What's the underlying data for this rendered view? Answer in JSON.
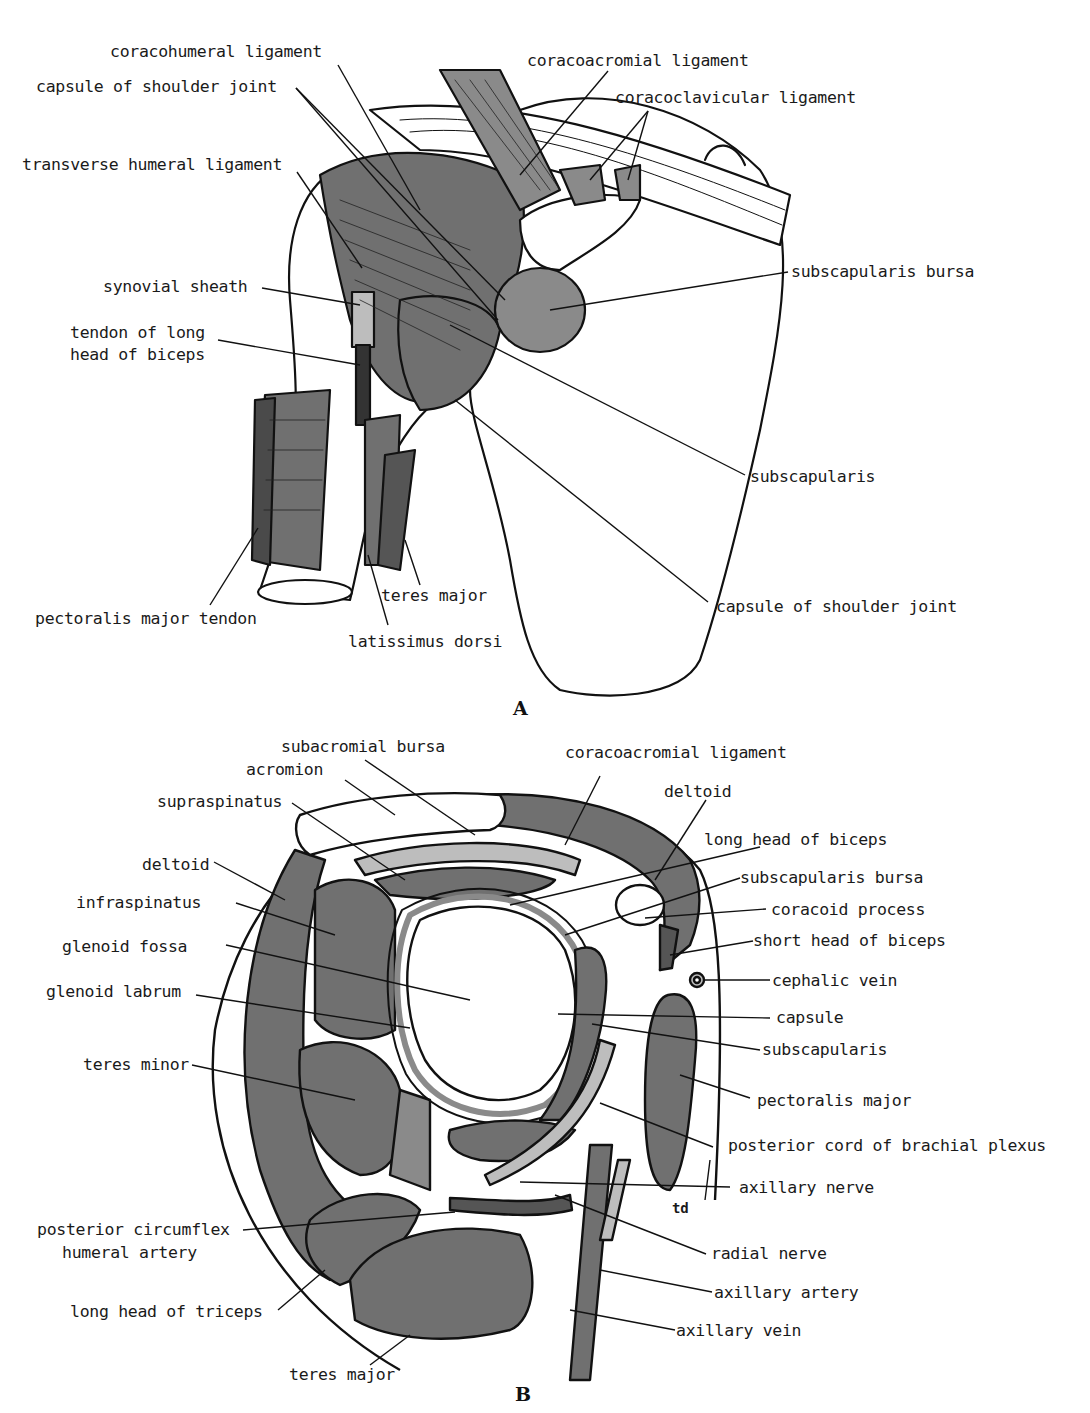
{
  "figure": {
    "panels": [
      {
        "letter": "A",
        "description": "Anterior view of right shoulder joint ligaments",
        "labels": {
          "coracohumeral_ligament": "coracohumeral ligament",
          "capsule_top": "capsule of shoulder joint",
          "transverse_humeral_ligament": "transverse humeral ligament",
          "synovial_sheath": "synovial sheath",
          "tendon_long_head_biceps_1": "tendon of long",
          "tendon_long_head_biceps_2": "head of biceps",
          "pectoralis_major_tendon": "pectoralis major tendon",
          "latissimus_dorsi": "latissimus dorsi",
          "teres_major": "teres major",
          "coracoacromial_ligament": "coracoacromial ligament",
          "coracoclavicular_ligament": "coracoclavicular ligament",
          "subscapularis_bursa": "subscapularis bursa",
          "subscapularis": "subscapularis",
          "capsule_bottom": "capsule of shoulder joint"
        }
      },
      {
        "letter": "B",
        "description": "Horizontal section through shoulder joint",
        "labels": {
          "subacromial_bursa": "subacromial bursa",
          "acromion": "acromion",
          "supraspinatus": "supraspinatus",
          "deltoid_left": "deltoid",
          "infraspinatus": "infraspinatus",
          "glenoid_fossa": "glenoid fossa",
          "glenoid_labrum": "glenoid labrum",
          "teres_minor": "teres minor",
          "post_circumflex_1": "posterior circumflex",
          "post_circumflex_2": "humeral artery",
          "long_head_triceps": "long head of triceps",
          "teres_major": "teres major",
          "coracoacromial_ligament": "coracoacromial ligament",
          "deltoid_right": "deltoid",
          "long_head_biceps": "long head of biceps",
          "subscapularis_bursa": "subscapularis bursa",
          "coracoid_process": "coracoid process",
          "short_head_biceps": "short head of biceps",
          "cephalic_vein": "cephalic vein",
          "capsule": "capsule",
          "subscapularis": "subscapularis",
          "pectoralis_major": "pectoralis major",
          "posterior_cord": "posterior cord of brachial plexus",
          "axillary_nerve": "axillary nerve",
          "radial_nerve": "radial nerve",
          "axillary_artery": "axillary artery",
          "axillary_vein": "axillary vein",
          "signature": "td"
        }
      }
    ],
    "colors": {
      "muscle_fill": "#707070",
      "ligament_fill": "#8a8a8a",
      "light_fill": "#bdbdbd",
      "bone_fill": "#ffffff",
      "line": "#111111"
    }
  }
}
